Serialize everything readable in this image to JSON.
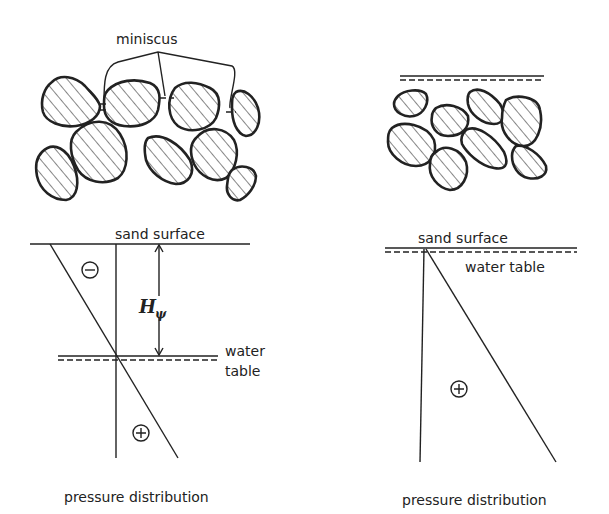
{
  "left_panel": {
    "meniscus_label": "miniscus",
    "sand_surface_label": "sand surface",
    "head_symbol": "H",
    "head_subscript": "ψ",
    "water_label_line1": "water",
    "water_label_line2": "table",
    "negative_sign": "−",
    "positive_sign": "+",
    "caption": "pressure distribution"
  },
  "right_panel": {
    "sand_surface_label": "sand surface",
    "water_table_label": "water table",
    "positive_sign": "+",
    "caption": "pressure distribution"
  },
  "colors": {
    "ink": "#222222",
    "background": "#ffffff"
  }
}
